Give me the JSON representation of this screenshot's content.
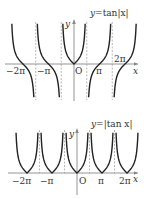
{
  "chart_data": [
    {
      "type": "line",
      "title": "y=tan|x|",
      "xlabel": "x",
      "ylabel": "y",
      "origin_label": "O",
      "x_tick_labels": [
        "−2π",
        "−π",
        "π",
        "2π"
      ],
      "x_ticks": [
        -6.2832,
        -3.1416,
        3.1416,
        6.2832
      ],
      "asymptotes": [
        -4.7124,
        -1.5708,
        1.5708,
        4.7124
      ],
      "asymptote_labels": [
        "−3π/2",
        "−π/2",
        "π/2",
        "3π/2"
      ],
      "xlim": [
        -8.0,
        8.0
      ],
      "grid": false,
      "legend": null,
      "series": [
        {
          "name": "y=tan|x|",
          "formula": "tan(|x|)"
        }
      ]
    },
    {
      "type": "line",
      "title": "y=|tan x|",
      "xlabel": "x",
      "ylabel": "y",
      "origin_label": "O",
      "x_tick_labels": [
        "−2π",
        "−π",
        "π",
        "2π"
      ],
      "x_ticks": [
        -6.2832,
        -3.1416,
        3.1416,
        6.2832
      ],
      "asymptotes": [
        -4.7124,
        -1.5708,
        1.5708,
        4.7124
      ],
      "asymptote_labels": [
        "−3π/2",
        "−π/2",
        "π/2",
        "3π/2"
      ],
      "xlim": [
        -8.0,
        8.0
      ],
      "grid": false,
      "legend": null,
      "series": [
        {
          "name": "y=|tan x|",
          "formula": "|tan(x)|"
        }
      ]
    }
  ],
  "top": {
    "equation_prefix": "y",
    "equation_mid": "=tan",
    "equation_abs": "|x|",
    "y_label": "y",
    "x_label": "x",
    "origin": "O",
    "ticks": {
      "m2pi": "−2π",
      "mpi": "−π",
      "pi": "π",
      "p2pi": "2π"
    }
  },
  "bottom": {
    "equation_prefix": "y",
    "equation_mid": "=",
    "equation_abs": "|tan x|",
    "y_label": "y",
    "x_label": "x",
    "origin": "O",
    "ticks": {
      "m2pi": "−2π",
      "mpi": "−π",
      "pi": "π",
      "p2pi": "2π"
    }
  },
  "colors": {
    "curve": "#222222",
    "axis": "#888888",
    "asymptote": "#999999",
    "text": "#333333"
  }
}
